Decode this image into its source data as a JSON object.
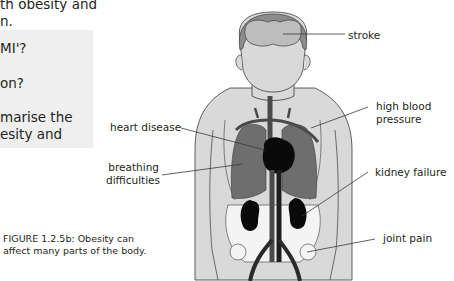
{
  "intro_text": {
    "line1": "th obesity and",
    "line2": "n."
  },
  "questions": [
    {
      "text": "MI'?"
    },
    {
      "text": "on?"
    },
    {
      "text": "marise the"
    },
    {
      "text": "esity and"
    }
  ],
  "figure": {
    "caption_line1": "FIGURE 1.2.5b: Obesity can",
    "caption_line2": "affect many parts of the body.",
    "labels": {
      "stroke": "stroke",
      "high_blood_pressure_line1": "high blood",
      "high_blood_pressure_line2": "pressure",
      "heart_disease": "heart disease",
      "breathing_difficulties_line1": "breathing",
      "breathing_difficulties_line2": "difficulties",
      "kidney_failure": "kidney failure",
      "joint_pain": "joint pain"
    },
    "colors": {
      "body": "#d9d9d9",
      "hair": "#8c8c8c",
      "brain": "#bdbdbd",
      "lungs": "#6e6e6e",
      "organs": "#0a0a0a",
      "vessels": "#4a4a4a",
      "outline": "#3a3a3a",
      "question_box": "#efefef"
    }
  }
}
